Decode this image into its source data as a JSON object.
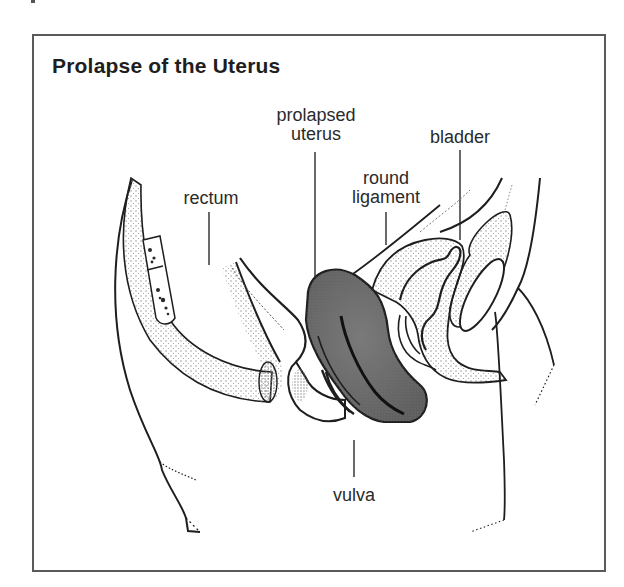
{
  "figure": {
    "title": "Prolapse of the Uterus",
    "labels": {
      "prolapsed_uterus_line1": "prolapsed",
      "prolapsed_uterus_line2": "uterus",
      "bladder": "bladder",
      "round_ligament_line1": "round",
      "round_ligament_line2": "ligament",
      "rectum": "rectum",
      "vulva": "vulva"
    },
    "colors": {
      "frame": "#5a5a5a",
      "line": "#1e1e1e",
      "uterus_fill": "#6e6e6e",
      "stipple": "#9a9a9a",
      "background": "#ffffff"
    }
  }
}
